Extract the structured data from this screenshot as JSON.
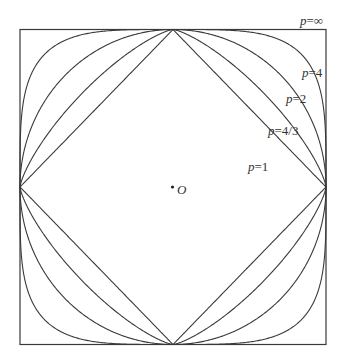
{
  "diagram": {
    "origin_label": "O",
    "geometry": {
      "center": [
        173,
        187
      ],
      "half_width": 153,
      "half_height": 157.5
    },
    "curves": [
      {
        "id": "p1",
        "p": 1,
        "label_var": "p",
        "label_eq": "=",
        "label_val": "1",
        "label_pos": [
          248,
          171
        ]
      },
      {
        "id": "p43",
        "p": 1.3333,
        "label_var": "p",
        "label_eq": "=",
        "label_val": "4/3",
        "label_pos": [
          268,
          135
        ]
      },
      {
        "id": "p2",
        "p": 2,
        "label_var": "p",
        "label_eq": "=",
        "label_val": "2",
        "label_pos": [
          286,
          103
        ]
      },
      {
        "id": "p4",
        "p": 4,
        "label_var": "p",
        "label_eq": "=",
        "label_val": "4",
        "label_pos": [
          302,
          77
        ]
      },
      {
        "id": "pinf",
        "p": "inf",
        "label_var": "p",
        "label_eq": "=",
        "label_val": "∞",
        "label_pos": [
          300,
          25
        ]
      }
    ],
    "stroke_color": "#3a3a3a",
    "background": "#ffffff"
  }
}
